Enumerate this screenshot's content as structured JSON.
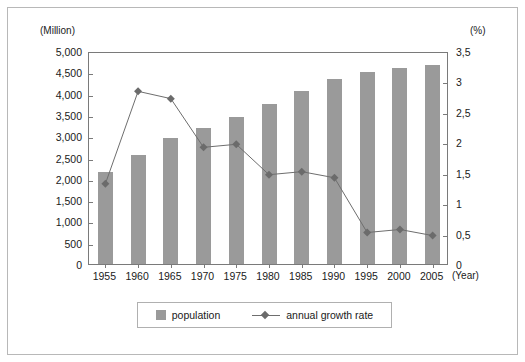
{
  "axes": {
    "left_unit": "(Million)",
    "right_unit": "(%)",
    "x_unit": "(Year)"
  },
  "legend": {
    "population_label": "population",
    "growth_label": "annual growth rate"
  },
  "colors": {
    "bar": "#9a9a9a",
    "line": "#6e6e6e",
    "marker": "#6b6b6b",
    "frame": "#7a7a7a",
    "border": "#b8b8b8",
    "text": "#1a1a1a"
  },
  "chart_data": {
    "type": "bar",
    "title": "",
    "subtitle": "",
    "xlabel": "(Year)",
    "ylabel": "(Million)",
    "y2label": "(%)",
    "grid": false,
    "legend_position": "bottom",
    "categories": [
      "1955",
      "1960",
      "1965",
      "1970",
      "1975",
      "1980",
      "1985",
      "1990",
      "1995",
      "2000",
      "2005"
    ],
    "ylim": [
      0,
      5000
    ],
    "yticks": [
      "0",
      "500",
      "1,000",
      "1,500",
      "2,000",
      "2,500",
      "3,000",
      "3,500",
      "4,000",
      "4,500",
      "5,000"
    ],
    "ytick_values": [
      0,
      500,
      1000,
      1500,
      2000,
      2500,
      3000,
      3500,
      4000,
      4500,
      5000
    ],
    "y2lim": [
      0,
      3.5
    ],
    "y2ticks": [
      "0",
      "0,5",
      "1",
      "1,5",
      "2",
      "2,5",
      "3",
      "3,5"
    ],
    "y2tick_values": [
      0,
      0.5,
      1,
      1.5,
      2,
      2.5,
      3,
      3.5
    ],
    "series": [
      {
        "name": "population",
        "type": "bar",
        "axis": "left",
        "units": "Million",
        "values": [
          2150,
          2550,
          2950,
          3200,
          3450,
          3750,
          4050,
          4350,
          4500,
          4600,
          4670
        ]
      },
      {
        "name": "annual growth rate",
        "type": "line",
        "axis": "right",
        "units": "%",
        "marker": "diamond",
        "values": [
          1.35,
          2.87,
          2.75,
          1.95,
          2.0,
          1.5,
          1.55,
          1.45,
          0.55,
          0.6,
          0.5
        ]
      }
    ]
  }
}
